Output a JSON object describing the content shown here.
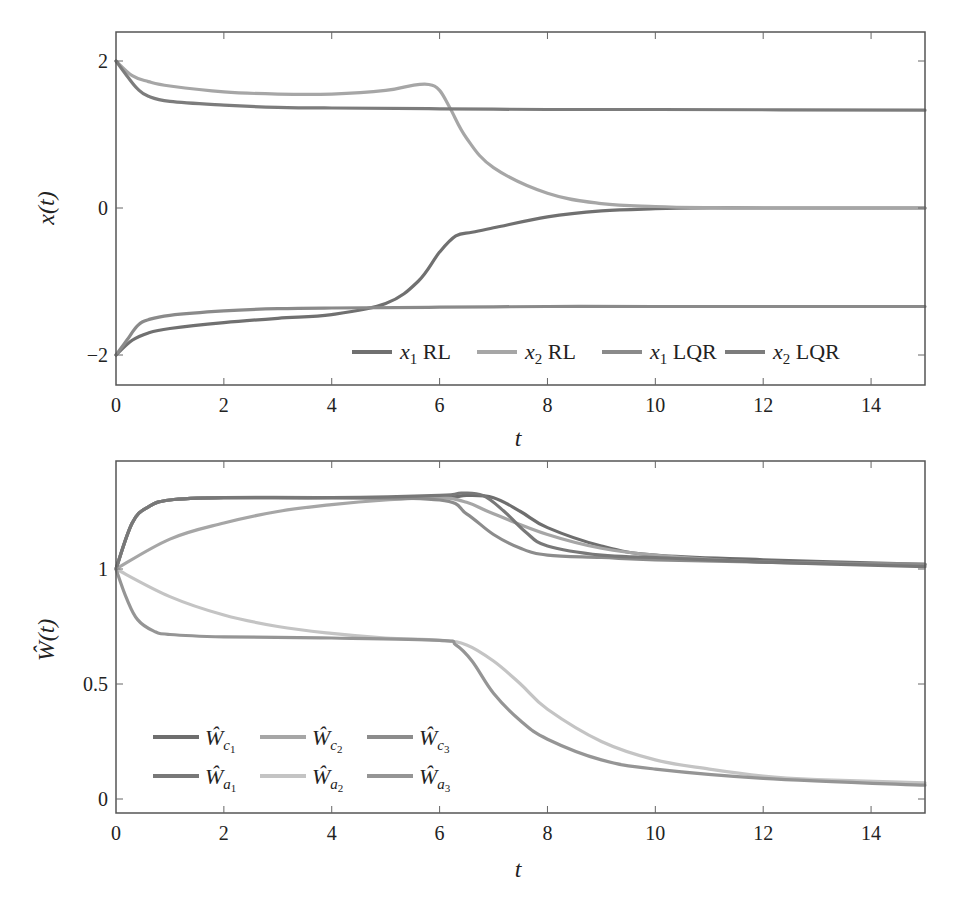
{
  "chart_data": [
    {
      "type": "line",
      "title": "",
      "xlabel": "t",
      "ylabel": "x(t)",
      "xlim": [
        0,
        15
      ],
      "ylim": [
        -2.4,
        2.4
      ],
      "xticks": [
        "0",
        "2",
        "4",
        "6",
        "8",
        "10",
        "12",
        "14"
      ],
      "yticks": [
        "−2",
        "0",
        "2"
      ],
      "grid": false,
      "legend_position": "lower right, single row",
      "series": [
        {
          "name": "x1 RL",
          "color": "#707070",
          "x": [
            0,
            0.3,
            0.6,
            1,
            2,
            3,
            4,
            5,
            5.6,
            6,
            6.3,
            6.6,
            7,
            8,
            9,
            10,
            11,
            12,
            15
          ],
          "y": [
            -2,
            -1.8,
            -1.7,
            -1.64,
            -1.56,
            -1.5,
            -1.45,
            -1.3,
            -1.0,
            -0.6,
            -0.38,
            -0.33,
            -0.27,
            -0.12,
            -0.04,
            -0.01,
            0,
            0,
            0
          ]
        },
        {
          "name": "x2 RL",
          "color": "#a6a6a6",
          "x": [
            0,
            0.3,
            0.6,
            1,
            2,
            3,
            4,
            5,
            5.5,
            5.8,
            6.0,
            6.2,
            6.5,
            7,
            8,
            9,
            10,
            11,
            12,
            15
          ],
          "y": [
            2,
            1.8,
            1.72,
            1.66,
            1.58,
            1.55,
            1.55,
            1.6,
            1.67,
            1.68,
            1.6,
            1.35,
            0.95,
            0.55,
            0.2,
            0.06,
            0.02,
            0.005,
            0,
            0
          ]
        },
        {
          "name": "x1 LQR",
          "color": "#8a8a8a",
          "x": [
            0,
            0.2,
            0.4,
            0.6,
            1,
            2,
            3,
            4,
            6,
            8,
            10,
            15
          ],
          "y": [
            -2,
            -1.8,
            -1.6,
            -1.52,
            -1.46,
            -1.4,
            -1.37,
            -1.36,
            -1.35,
            -1.34,
            -1.34,
            -1.34
          ]
        },
        {
          "name": "x2 LQR",
          "color": "#7c7c7c",
          "x": [
            0,
            0.2,
            0.4,
            0.6,
            1,
            2,
            3,
            4,
            6,
            8,
            10,
            15
          ],
          "y": [
            2,
            1.8,
            1.62,
            1.52,
            1.45,
            1.4,
            1.37,
            1.36,
            1.35,
            1.34,
            1.34,
            1.33
          ]
        }
      ]
    },
    {
      "type": "line",
      "title": "",
      "xlabel": "t",
      "ylabel": "Ŵ(t)",
      "xlim": [
        0,
        15
      ],
      "ylim": [
        -0.07,
        1.47
      ],
      "xticks": [
        "0",
        "2",
        "4",
        "6",
        "8",
        "10",
        "12",
        "14"
      ],
      "yticks": [
        "0",
        "0.5",
        "1"
      ],
      "grid": false,
      "legend_position": "lower left, 3 columns x 2 rows",
      "series": [
        {
          "name": "Ŵc1",
          "color": "#6e6e6e",
          "x": [
            0,
            0.3,
            0.6,
            1,
            2,
            4,
            6,
            6.5,
            7.0,
            7.5,
            8,
            9,
            10,
            12,
            15
          ],
          "y": [
            1,
            1.2,
            1.27,
            1.3,
            1.31,
            1.31,
            1.31,
            1.32,
            1.31,
            1.25,
            1.18,
            1.1,
            1.06,
            1.04,
            1.02
          ]
        },
        {
          "name": "Ŵc2",
          "color": "#a6a6a6",
          "x": [
            0,
            1,
            2,
            3,
            4,
            5,
            6,
            6.5,
            7,
            8,
            9,
            10,
            12,
            15
          ],
          "y": [
            1,
            1.13,
            1.2,
            1.25,
            1.28,
            1.3,
            1.31,
            1.29,
            1.24,
            1.15,
            1.09,
            1.06,
            1.03,
            1.02
          ]
        },
        {
          "name": "Ŵc3",
          "color": "#8c8c8c",
          "x": [
            0,
            0.3,
            0.6,
            1,
            2,
            4,
            6,
            6.5,
            7,
            7.5,
            8,
            9,
            10,
            12,
            15
          ],
          "y": [
            1,
            1.2,
            1.27,
            1.3,
            1.31,
            1.31,
            1.3,
            1.24,
            1.15,
            1.09,
            1.06,
            1.05,
            1.04,
            1.03,
            1.02
          ]
        },
        {
          "name": "Ŵa1",
          "color": "#787878",
          "x": [
            0,
            0.3,
            0.6,
            1,
            2,
            4,
            6,
            6.4,
            6.8,
            7.2,
            7.6,
            8,
            9,
            10,
            12,
            15
          ],
          "y": [
            1,
            1.2,
            1.27,
            1.3,
            1.31,
            1.31,
            1.32,
            1.33,
            1.32,
            1.25,
            1.16,
            1.1,
            1.06,
            1.05,
            1.03,
            1.01
          ]
        },
        {
          "name": "Ŵa2",
          "color": "#c4c4c4",
          "x": [
            0,
            1,
            2,
            3,
            4,
            5,
            6,
            6.5,
            7,
            7.5,
            8,
            9,
            10,
            11,
            12,
            13,
            15
          ],
          "y": [
            1,
            0.88,
            0.8,
            0.75,
            0.72,
            0.7,
            0.69,
            0.67,
            0.6,
            0.5,
            0.39,
            0.25,
            0.17,
            0.13,
            0.1,
            0.085,
            0.07
          ]
        },
        {
          "name": "Ŵa3",
          "color": "#959595",
          "x": [
            0,
            0.2,
            0.4,
            0.7,
            1,
            2,
            4,
            6,
            6.3,
            6.6,
            7,
            7.5,
            8,
            9,
            10,
            12,
            15
          ],
          "y": [
            1,
            0.87,
            0.78,
            0.73,
            0.715,
            0.705,
            0.7,
            0.69,
            0.67,
            0.6,
            0.46,
            0.34,
            0.26,
            0.17,
            0.13,
            0.09,
            0.06
          ]
        }
      ]
    }
  ],
  "top": {
    "ylabel": "x(t)",
    "xlabel": "t",
    "legend": [
      {
        "var": "x",
        "sub": "1",
        "suffix": " RL"
      },
      {
        "var": "x",
        "sub": "2",
        "suffix": " RL"
      },
      {
        "var": "x",
        "sub": "1",
        "suffix": " LQR"
      },
      {
        "var": "x",
        "sub": "2",
        "suffix": " LQR"
      }
    ]
  },
  "bottom": {
    "ylabel": "Ŵ(t)",
    "xlabel": "t",
    "legend": [
      {
        "var": "Ŵ",
        "sub": "c",
        "subsub": "1"
      },
      {
        "var": "Ŵ",
        "sub": "c",
        "subsub": "2"
      },
      {
        "var": "Ŵ",
        "sub": "c",
        "subsub": "3"
      },
      {
        "var": "Ŵ",
        "sub": "a",
        "subsub": "1"
      },
      {
        "var": "Ŵ",
        "sub": "a",
        "subsub": "2"
      },
      {
        "var": "Ŵ",
        "sub": "a",
        "subsub": "3"
      }
    ]
  }
}
